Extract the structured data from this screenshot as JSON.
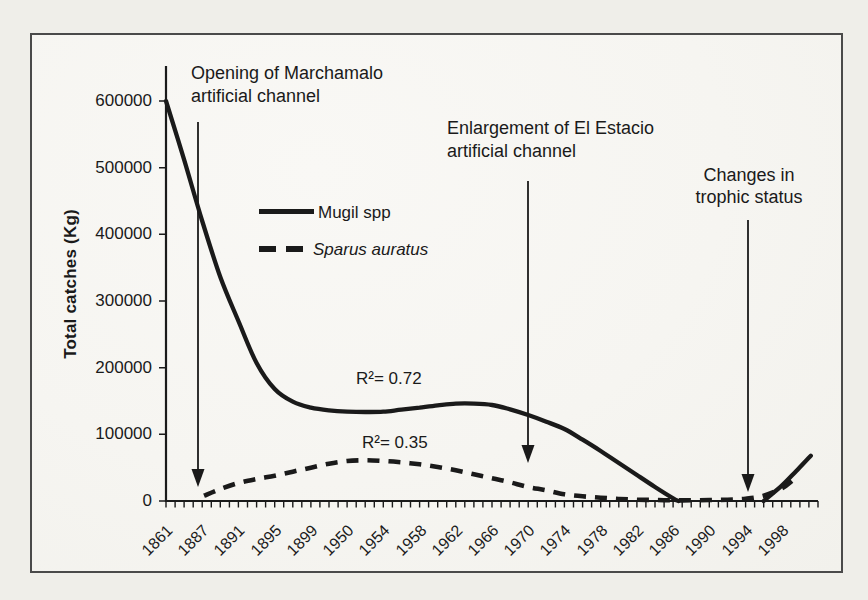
{
  "page": {
    "background": "#efeee9",
    "panel_background": "#f6f5f1",
    "border_color": "#4a4a4a",
    "ink": "#1a1a1a"
  },
  "chart_data": {
    "type": "line",
    "title": "",
    "xlabel": "",
    "ylabel": "Total catches (Kg)",
    "ylim": [
      0,
      600000
    ],
    "yticks": [
      600000,
      500000,
      400000,
      300000,
      200000,
      100000,
      0
    ],
    "grid": false,
    "legend_position": "inside upper-left",
    "categories": [
      "1861",
      "1887",
      "1891",
      "1895",
      "1899",
      "1950",
      "1954",
      "1958",
      "1962",
      "1966",
      "1970",
      "1974",
      "1978",
      "1982",
      "1986",
      "1990",
      "1994",
      "1998"
    ],
    "series": [
      {
        "name": "Mugil spp",
        "line_style": "solid",
        "r_squared": 0.72,
        "r2_label": "R²= 0.72",
        "values": [
          600000,
          420000,
          270000,
          168000,
          140000,
          134000,
          134000,
          140000,
          146000,
          144000,
          129000,
          108000,
          75000,
          39000,
          3000,
          0,
          0,
          23000
        ],
        "points": [
          [
            0,
            600000
          ],
          [
            0.5,
            512000
          ],
          [
            1,
            420000
          ],
          [
            1.5,
            336000
          ],
          [
            2,
            270000
          ],
          [
            2.5,
            207000
          ],
          [
            3,
            168000
          ],
          [
            3.5,
            149000
          ],
          [
            4,
            140000
          ],
          [
            4.5,
            136000
          ],
          [
            5,
            134000
          ],
          [
            5.5,
            133500
          ],
          [
            6,
            134000
          ],
          [
            6.5,
            137000
          ],
          [
            7,
            140000
          ],
          [
            7.5,
            143500
          ],
          [
            8,
            146000
          ],
          [
            8.5,
            146000
          ],
          [
            9,
            144000
          ],
          [
            9.5,
            137500
          ],
          [
            10,
            129000
          ],
          [
            10.5,
            119000
          ],
          [
            11,
            108000
          ],
          [
            11.5,
            92000
          ],
          [
            12,
            75000
          ],
          [
            12.5,
            57000
          ],
          [
            13,
            39000
          ],
          [
            13.5,
            21000
          ],
          [
            14,
            4000
          ],
          [
            14.15,
            0
          ]
        ],
        "tail_points": [
          [
            16.5,
            0
          ],
          [
            17,
            23000
          ],
          [
            17.4,
            45000
          ],
          [
            17.8,
            68000
          ]
        ]
      },
      {
        "name": "Sparus auratus",
        "line_style": "dashed",
        "r_squared": 0.35,
        "r2_label": "R²= 0.35",
        "values": [
          null,
          8000,
          27000,
          38000,
          50000,
          60000,
          60000,
          55000,
          46000,
          34000,
          21000,
          10000,
          5000,
          2000,
          1000,
          1500,
          3500,
          19000
        ],
        "points": [
          [
            1.05,
            8000
          ],
          [
            1.5,
            18000
          ],
          [
            2,
            27000
          ],
          [
            2.5,
            33000
          ],
          [
            3,
            38000
          ],
          [
            3.5,
            44000
          ],
          [
            4,
            50000
          ],
          [
            4.5,
            56000
          ],
          [
            5,
            60000
          ],
          [
            5.5,
            61000
          ],
          [
            6,
            60000
          ],
          [
            6.5,
            58000
          ],
          [
            7,
            55000
          ],
          [
            7.5,
            51000
          ],
          [
            8,
            46000
          ],
          [
            8.5,
            40000
          ],
          [
            9,
            34000
          ],
          [
            9.5,
            28000
          ],
          [
            10,
            21000
          ],
          [
            10.5,
            16000
          ],
          [
            11,
            10000
          ],
          [
            11.5,
            7000
          ],
          [
            12,
            5000
          ],
          [
            12.5,
            3000
          ],
          [
            13,
            2000
          ],
          [
            13.5,
            1500
          ],
          [
            14,
            1000
          ],
          [
            14.5,
            1000
          ],
          [
            15,
            1500
          ],
          [
            15.5,
            2000
          ],
          [
            16,
            3500
          ],
          [
            16.5,
            8000
          ],
          [
            17,
            19000
          ],
          [
            17.3,
            31000
          ]
        ]
      }
    ],
    "annotations": [
      {
        "line1": "Opening of Marchamalo",
        "line2": "artificial channel",
        "arrow_points_to_year": "1888"
      },
      {
        "line1": "Enlargement of El Estacio",
        "line2": "artificial channel",
        "arrow_points_to_year": "1970"
      },
      {
        "line1": "Changes in",
        "line2": "trophic status",
        "arrow_points_to_year": "1994"
      }
    ]
  }
}
